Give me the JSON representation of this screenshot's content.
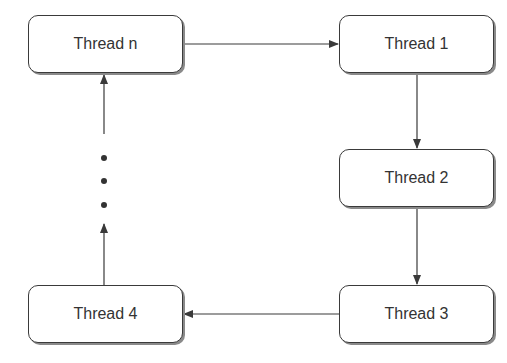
{
  "diagram": {
    "type": "flowchart",
    "nodes": [
      {
        "id": "thread_n",
        "label": "Thread n"
      },
      {
        "id": "thread_1",
        "label": "Thread 1"
      },
      {
        "id": "thread_2",
        "label": "Thread 2"
      },
      {
        "id": "thread_3",
        "label": "Thread 3"
      },
      {
        "id": "thread_4",
        "label": "Thread 4"
      }
    ],
    "edges": [
      {
        "from": "thread_n",
        "to": "thread_1"
      },
      {
        "from": "thread_1",
        "to": "thread_2"
      },
      {
        "from": "thread_2",
        "to": "thread_3"
      },
      {
        "from": "thread_3",
        "to": "thread_4"
      },
      {
        "from": "thread_4",
        "to": "ellipsis"
      },
      {
        "from": "ellipsis",
        "to": "thread_n"
      }
    ],
    "ellipsis": "vertical dots (⋮) indicating intermediate threads between Thread 4 and Thread n",
    "colors": {
      "line": "#3a3a3a",
      "text": "#333333",
      "background": "#ffffff"
    }
  }
}
